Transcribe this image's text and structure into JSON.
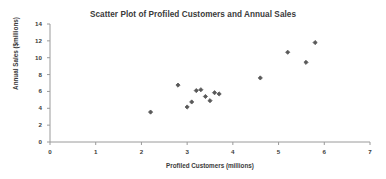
{
  "chart_data": {
    "type": "scatter",
    "title": "Scatter Plot of Profiled Customers and Annual Sales",
    "xlabel": "Profiled Customers (millions)",
    "ylabel": "Annual Sales ($millions)",
    "xlim": [
      0,
      7
    ],
    "ylim": [
      0,
      14
    ],
    "xticks": [
      0,
      1,
      2,
      3,
      4,
      5,
      6,
      7
    ],
    "yticks": [
      0,
      2,
      4,
      6,
      8,
      10,
      12,
      14
    ],
    "xtick_labels": [
      "0",
      "1",
      "2",
      "3",
      "4",
      "5",
      "6",
      "7"
    ],
    "ytick_labels": [
      "0",
      "2",
      "4",
      "6",
      "8",
      "10",
      "12",
      "14"
    ],
    "grid": false,
    "legend": null,
    "marker": "diamond",
    "marker_color": "#595959",
    "axis_color": "#9a9a9a",
    "text_color": "#3a3a3a",
    "background_color": "#ffffff",
    "x": [
      2.2,
      2.8,
      3.0,
      3.1,
      3.2,
      3.3,
      3.4,
      3.5,
      3.6,
      3.7,
      4.6,
      5.2,
      5.6,
      5.8
    ],
    "y": [
      3.55,
      6.75,
      4.15,
      4.75,
      6.1,
      6.2,
      5.4,
      4.9,
      5.85,
      5.7,
      7.6,
      10.65,
      9.45,
      11.8
    ],
    "points": [
      {
        "x": 2.2,
        "y": 3.55
      },
      {
        "x": 2.8,
        "y": 6.75
      },
      {
        "x": 3.0,
        "y": 4.15
      },
      {
        "x": 3.1,
        "y": 4.75
      },
      {
        "x": 3.2,
        "y": 6.1
      },
      {
        "x": 3.3,
        "y": 6.2
      },
      {
        "x": 3.4,
        "y": 5.4
      },
      {
        "x": 3.5,
        "y": 4.9
      },
      {
        "x": 3.6,
        "y": 5.85
      },
      {
        "x": 3.7,
        "y": 5.7
      },
      {
        "x": 4.6,
        "y": 7.6
      },
      {
        "x": 5.2,
        "y": 10.65
      },
      {
        "x": 5.6,
        "y": 9.45
      },
      {
        "x": 5.8,
        "y": 11.8
      }
    ]
  }
}
